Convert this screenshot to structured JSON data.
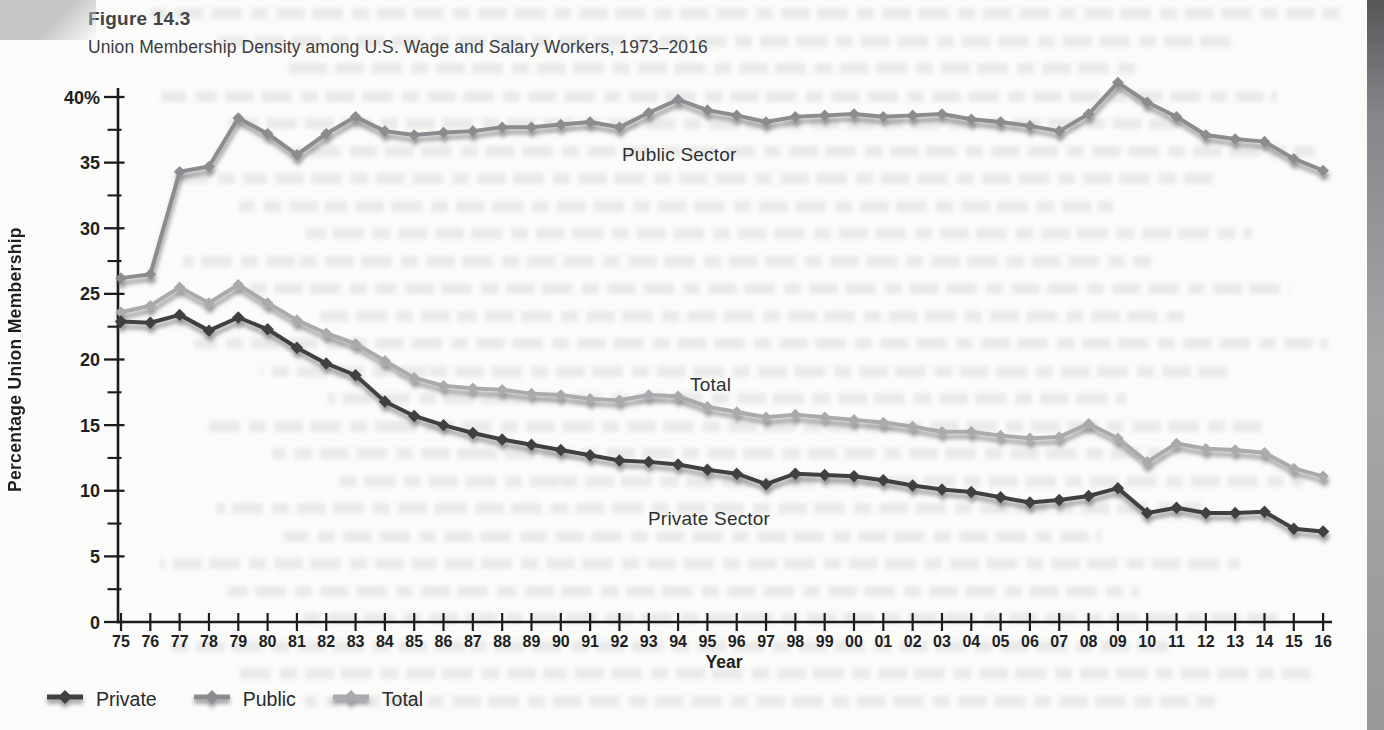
{
  "figure": {
    "label": "Figure 14.3",
    "title": "Union Membership Density among U.S. Wage and Salary Workers, 1973–2016"
  },
  "chart_data": {
    "type": "line",
    "title": "Union Membership Density among U.S. Wage and Salary Workers, 1973–2016",
    "xlabel": "Year",
    "ylabel": "Percentage Union Membership",
    "ylim": [
      0,
      40
    ],
    "grid": false,
    "legend_position": "bottom-left",
    "y_major_ticks": [
      0,
      5,
      10,
      15,
      20,
      25,
      30,
      35,
      40
    ],
    "y_tick_labels": [
      "0",
      "5",
      "10",
      "15",
      "20",
      "25",
      "30",
      "35",
      "40%"
    ],
    "y_minor_step": 2.5,
    "x_categories": [
      "75",
      "76",
      "77",
      "78",
      "79",
      "80",
      "81",
      "82",
      "83",
      "84",
      "85",
      "86",
      "87",
      "88",
      "89",
      "90",
      "91",
      "92",
      "93",
      "94",
      "95",
      "96",
      "97",
      "98",
      "99",
      "00",
      "01",
      "02",
      "03",
      "04",
      "05",
      "06",
      "07",
      "08",
      "09",
      "10",
      "11",
      "12",
      "13",
      "14",
      "15",
      "16"
    ],
    "series": [
      {
        "name": "Private",
        "sector_label": "Private Sector",
        "color": "#3f4143",
        "values": [
          22.9,
          22.8,
          23.4,
          22.2,
          23.2,
          22.3,
          20.9,
          19.7,
          18.8,
          16.8,
          15.7,
          15.0,
          14.4,
          13.9,
          13.5,
          13.1,
          12.7,
          12.3,
          12.2,
          12.0,
          11.6,
          11.3,
          10.5,
          11.3,
          11.2,
          11.1,
          10.8,
          10.4,
          10.1,
          9.9,
          9.5,
          9.1,
          9.3,
          9.6,
          10.2,
          8.3,
          8.7,
          8.3,
          8.3,
          8.4,
          7.1,
          6.9
        ]
      },
      {
        "name": "Public",
        "sector_label": "Public Sector",
        "color": "#8a8c8f",
        "values": [
          26.2,
          26.5,
          34.3,
          34.7,
          38.4,
          37.2,
          35.6,
          37.2,
          38.5,
          37.4,
          37.1,
          37.3,
          37.4,
          37.7,
          37.7,
          37.9,
          38.1,
          37.7,
          38.8,
          39.8,
          39.0,
          38.6,
          38.1,
          38.5,
          38.6,
          38.7,
          38.5,
          38.6,
          38.7,
          38.3,
          38.1,
          37.8,
          37.4,
          38.7,
          41.1,
          39.6,
          38.5,
          37.1,
          36.8,
          36.6,
          35.3,
          34.4
        ]
      },
      {
        "name": "Total",
        "sector_label": "Total",
        "color": "#a8aaad",
        "values": [
          23.6,
          24.1,
          25.5,
          24.3,
          25.7,
          24.3,
          23.0,
          22.0,
          21.2,
          19.9,
          18.6,
          18.0,
          17.8,
          17.7,
          17.4,
          17.3,
          17.0,
          16.9,
          17.3,
          17.2,
          16.4,
          16.0,
          15.6,
          15.8,
          15.6,
          15.4,
          15.2,
          14.9,
          14.5,
          14.5,
          14.2,
          14.0,
          14.1,
          15.1,
          14.0,
          12.2,
          13.6,
          13.2,
          13.1,
          12.9,
          11.7,
          11.1
        ]
      }
    ],
    "annotations": [
      {
        "text": "Public Sector"
      },
      {
        "text": "Total"
      },
      {
        "text": "Private Sector"
      }
    ]
  },
  "colors": {
    "axis": "#1c1c1e",
    "tick_text": "#1e1f21",
    "shadow": "#46484a",
    "page_edge": "#86878a"
  }
}
